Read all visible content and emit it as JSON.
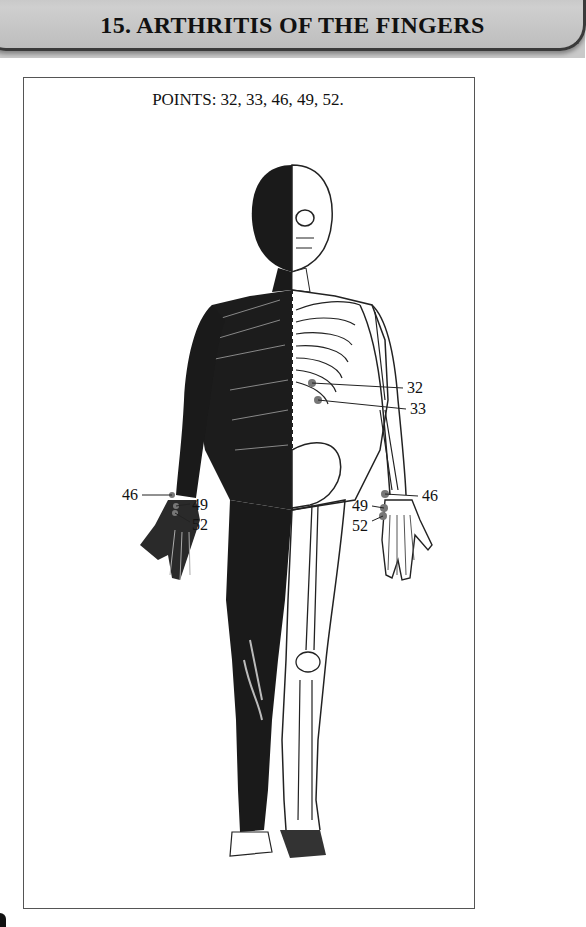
{
  "header": {
    "title": "15.  ARTHRITIS OF THE FINGERS"
  },
  "figure": {
    "points_caption": "POINTS: 32, 33, 46, 49, 52.",
    "labels": {
      "p32": "32",
      "p33": "33",
      "p46_left": "46",
      "p49_left": "49",
      "p52_left": "52",
      "p46_right": "46",
      "p49_right": "49",
      "p52_right": "52"
    }
  }
}
